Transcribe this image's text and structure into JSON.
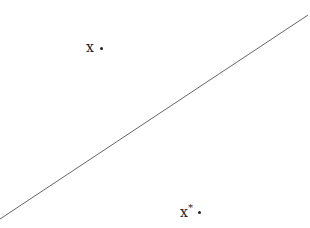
{
  "diagram": {
    "line": {
      "x1": 0,
      "y1": 219,
      "x2": 308,
      "y2": 15,
      "color": "#555555"
    },
    "points": [
      {
        "id": "x",
        "label": "x",
        "superscript": "",
        "label_pos": {
          "left": 86,
          "top": 40
        },
        "dot_pos": {
          "left": 100,
          "top": 47
        }
      },
      {
        "id": "x_star",
        "label": "x",
        "superscript": "*",
        "label_pos": {
          "left": 180,
          "top": 205
        },
        "dot_pos": {
          "left": 198,
          "top": 211
        }
      }
    ]
  }
}
